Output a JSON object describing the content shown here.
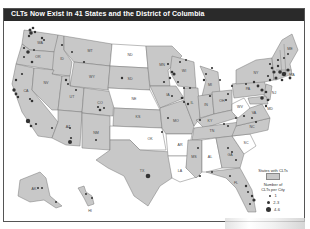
{
  "title": "CLTs Now Exist in 41 States and the District of Columbia",
  "colors": {
    "states_with_clts": "#c8c8c8",
    "states_without_clts": "#ffffff",
    "dots": "#333333",
    "title_bar": "#2a2a2a"
  },
  "states_without_clts": [
    "ND",
    "NE",
    "OK",
    "AR",
    "LA",
    "AL",
    "WV",
    "SC"
  ],
  "state_labels": [
    "WA",
    "OR",
    "CA",
    "ID",
    "NV",
    "MT",
    "WY",
    "UT",
    "AZ",
    "CO",
    "NM",
    "ND",
    "SD",
    "NE",
    "KS",
    "OK",
    "TX",
    "MN",
    "IA",
    "MO",
    "AR",
    "LA",
    "WI",
    "IL",
    "MI",
    "IN",
    "OH",
    "KY",
    "TN",
    "MS",
    "AL",
    "GA",
    "FL",
    "SC",
    "NC",
    "VA",
    "WV",
    "PA",
    "NY",
    "VT",
    "NH",
    "ME",
    "MA",
    "CT",
    "RI",
    "NJ",
    "DE",
    "MD",
    "DC",
    "AK",
    "HI"
  ],
  "legend": {
    "states_label": "States with CLTs",
    "dots_title_line1": "Number of",
    "dots_title_line2": "CLTs per City",
    "sizes": [
      {
        "label": "1",
        "size": 2
      },
      {
        "label": "2-3",
        "size": 3.2
      },
      {
        "label": "4-6",
        "size": 4.5
      }
    ]
  }
}
